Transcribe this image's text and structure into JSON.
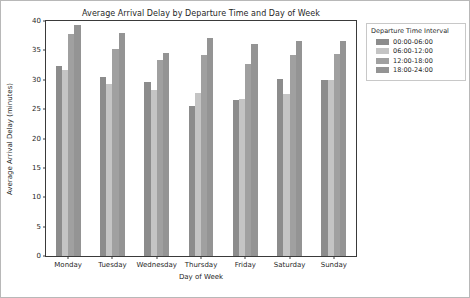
{
  "chart_data": {
    "type": "bar",
    "title": "Average Arrival Delay by Departure Time and Day of Week",
    "xlabel": "Day of Week",
    "ylabel": "Average Arrival Delay (minutes)",
    "categories": [
      "Monday",
      "Tuesday",
      "Wednesday",
      "Thursday",
      "Friday",
      "Saturday",
      "Sunday"
    ],
    "series": [
      {
        "name": "00:00-06:00",
        "color": "#8c8c8c",
        "values": [
          32.3,
          30.4,
          29.7,
          25.5,
          26.5,
          30.2,
          29.9
        ]
      },
      {
        "name": "06:00-12:00",
        "color": "#c4c4c4",
        "values": [
          31.6,
          29.2,
          28.2,
          27.7,
          26.7,
          27.6,
          30.0
        ]
      },
      {
        "name": "12:00-18:00",
        "color": "#a0a0a0",
        "values": [
          37.8,
          35.3,
          33.4,
          34.3,
          32.6,
          34.2,
          34.4
        ]
      },
      {
        "name": "18:00-24:00",
        "color": "#949494",
        "values": [
          39.4,
          37.9,
          34.5,
          37.1,
          36.1,
          36.6,
          36.6
        ]
      }
    ],
    "ylim": [
      0,
      40
    ],
    "yticks": [
      0,
      5,
      10,
      15,
      20,
      25,
      30,
      35,
      40
    ],
    "ytick_labels": [
      "0",
      "5",
      "10",
      "15",
      "20",
      "25",
      "30",
      "35",
      "40"
    ],
    "grid": false,
    "legend": {
      "title": "Departure Time Interval",
      "position": "right-outside"
    }
  }
}
